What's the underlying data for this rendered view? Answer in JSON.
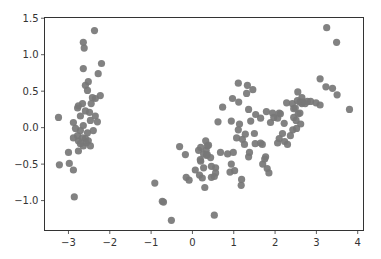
{
  "chart_data": {
    "type": "scatter",
    "title": "",
    "xlabel": "",
    "ylabel": "",
    "xlim": [
      -3.58,
      4.14
    ],
    "ylim": [
      -1.41,
      1.51
    ],
    "grid": false,
    "legend": null,
    "x_ticks": [
      -3,
      -2,
      -1,
      0,
      1,
      2,
      3,
      4
    ],
    "x_tick_labels": [
      "−3",
      "−2",
      "−1",
      "0",
      "1",
      "2",
      "3",
      "4"
    ],
    "y_ticks": [
      1.5,
      1.0,
      0.5,
      0.0,
      -0.5,
      -1.0
    ],
    "y_tick_labels": [
      "1.5",
      "1.0",
      "0.5",
      "0.0",
      "−0.5",
      "−1.0"
    ],
    "marker_color": "#777777",
    "series": [
      {
        "name": "points",
        "points": [
          [
            -2.37,
            1.33
          ],
          [
            -2.64,
            1.17
          ],
          [
            -2.62,
            1.09
          ],
          [
            -2.64,
            0.81
          ],
          [
            -2.2,
            0.88
          ],
          [
            -2.28,
            0.74
          ],
          [
            -2.52,
            0.63
          ],
          [
            -2.59,
            0.58
          ],
          [
            -2.54,
            0.51
          ],
          [
            -2.23,
            0.44
          ],
          [
            -2.35,
            0.4
          ],
          [
            -2.76,
            0.3
          ],
          [
            -2.78,
            0.27
          ],
          [
            -2.66,
            0.33
          ],
          [
            -3.24,
            0.14
          ],
          [
            -2.88,
            0.07
          ],
          [
            -2.64,
            0.03
          ],
          [
            -2.47,
            0.1
          ],
          [
            -2.35,
            0.16
          ],
          [
            -2.3,
            0.08
          ],
          [
            -2.4,
            -0.04
          ],
          [
            -2.88,
            -0.14
          ],
          [
            -2.76,
            -0.18
          ],
          [
            -2.59,
            -0.15
          ],
          [
            -2.52,
            -0.18
          ],
          [
            -2.78,
            -0.11
          ],
          [
            -2.66,
            -0.14
          ],
          [
            -2.71,
            -0.22
          ],
          [
            -2.57,
            -0.21
          ],
          [
            -2.64,
            -0.25
          ],
          [
            -3.0,
            -0.34
          ],
          [
            -2.76,
            -0.32
          ],
          [
            -3.22,
            -0.51
          ],
          [
            -2.98,
            -0.49
          ],
          [
            -2.88,
            -0.58
          ],
          [
            -2.86,
            -0.95
          ],
          [
            -2.47,
            -0.25
          ],
          [
            -2.71,
            -0.04
          ],
          [
            -2.83,
            -0.01
          ],
          [
            -2.54,
            -0.07
          ],
          [
            -2.45,
            0.33
          ],
          [
            -2.59,
            0.23
          ],
          [
            -2.49,
            0.21
          ],
          [
            -2.42,
            0.41
          ],
          [
            -2.71,
            0.16
          ],
          [
            -0.91,
            -0.76
          ],
          [
            -0.73,
            -1.01
          ],
          [
            -0.7,
            -1.02
          ],
          [
            -0.51,
            -1.27
          ],
          [
            -0.17,
            -0.37
          ],
          [
            -0.31,
            -0.26
          ],
          [
            -0.15,
            -0.68
          ],
          [
            -0.08,
            -0.72
          ],
          [
            0.17,
            -0.65
          ],
          [
            0.24,
            -0.69
          ],
          [
            0.3,
            -0.82
          ],
          [
            0.53,
            -1.2
          ],
          [
            0.07,
            -0.58
          ],
          [
            0.19,
            -0.44
          ],
          [
            0.27,
            -0.55
          ],
          [
            0.15,
            -0.31
          ],
          [
            0.27,
            -0.36
          ],
          [
            0.36,
            -0.25
          ],
          [
            0.46,
            -0.68
          ],
          [
            0.53,
            -0.67
          ],
          [
            0.56,
            -0.55
          ],
          [
            0.34,
            -0.38
          ],
          [
            0.46,
            -0.53
          ],
          [
            0.2,
            -0.46
          ],
          [
            0.56,
            -0.62
          ],
          [
            0.33,
            -0.31
          ],
          [
            0.44,
            -0.41
          ],
          [
            0.2,
            -0.27
          ],
          [
            0.32,
            -0.18
          ],
          [
            0.39,
            -0.24
          ],
          [
            0.36,
            -0.37
          ],
          [
            0.68,
            -0.34
          ],
          [
            0.62,
            0.08
          ],
          [
            0.73,
            0.28
          ],
          [
            0.94,
            0.09
          ],
          [
            0.85,
            -0.36
          ],
          [
            0.99,
            -0.34
          ],
          [
            1.07,
            -0.14
          ],
          [
            1.11,
            -0.03
          ],
          [
            1.21,
            -0.16
          ],
          [
            0.94,
            -0.5
          ],
          [
            1.26,
            -0.23
          ],
          [
            0.91,
            -0.61
          ],
          [
            1.18,
            -0.79
          ],
          [
            1.02,
            -0.59
          ],
          [
            1.19,
            -0.71
          ],
          [
            1.36,
            -0.4
          ],
          [
            1.38,
            -0.34
          ],
          [
            1.14,
            0.05
          ],
          [
            1.28,
            -0.09
          ],
          [
            1.41,
            0.09
          ],
          [
            1.52,
            -0.22
          ],
          [
            1.7,
            -0.5
          ],
          [
            1.81,
            -0.56
          ],
          [
            1.69,
            -0.23
          ],
          [
            1.5,
            -0.08
          ],
          [
            1.65,
            -0.21
          ],
          [
            1.85,
            -0.62
          ],
          [
            1.33,
            0.58
          ],
          [
            1.46,
            0.52
          ],
          [
            0.97,
            0.4
          ],
          [
            1.12,
            0.35
          ],
          [
            1.36,
            0.25
          ],
          [
            1.53,
            0.18
          ],
          [
            1.65,
            0.13
          ],
          [
            1.11,
            0.61
          ],
          [
            1.31,
            0.47
          ],
          [
            1.89,
            0.07
          ],
          [
            1.94,
            0.2
          ],
          [
            1.97,
            0.14
          ],
          [
            2.06,
            0.13
          ],
          [
            2.22,
            0.06
          ],
          [
            1.79,
            0.22
          ],
          [
            2.45,
            0.14
          ],
          [
            2.56,
            0.19
          ],
          [
            2.43,
            -0.03
          ],
          [
            2.62,
            0.05
          ],
          [
            2.51,
            0.1
          ],
          [
            2.1,
            0.2
          ],
          [
            2.13,
            0.19
          ],
          [
            2.45,
            0.26
          ],
          [
            2.6,
            0.35
          ],
          [
            2.28,
            0.34
          ],
          [
            2.18,
            -0.08
          ],
          [
            2.37,
            -0.11
          ],
          [
            2.1,
            -0.15
          ],
          [
            2.23,
            -0.19
          ],
          [
            2.06,
            -0.21
          ],
          [
            2.3,
            -0.23
          ],
          [
            1.77,
            -0.4
          ],
          [
            1.75,
            -0.43
          ],
          [
            2.42,
            0.33
          ],
          [
            2.65,
            0.41
          ],
          [
            2.52,
            -0.01
          ],
          [
            2.86,
            0.36
          ],
          [
            2.54,
            0.37
          ],
          [
            2.55,
            0.49
          ],
          [
            2.67,
            0.35
          ],
          [
            2.6,
            0.2
          ],
          [
            2.49,
            0.27
          ],
          [
            2.78,
            0.36
          ],
          [
            2.99,
            0.34
          ],
          [
            3.09,
            0.31
          ],
          [
            3.09,
            0.67
          ],
          [
            3.23,
            0.56
          ],
          [
            3.39,
            0.54
          ],
          [
            3.5,
            0.45
          ],
          [
            3.8,
            0.25
          ],
          [
            2.65,
            0.33
          ],
          [
            2.73,
            0.33
          ],
          [
            3.25,
            1.37
          ],
          [
            3.49,
            1.17
          ]
        ]
      }
    ]
  }
}
